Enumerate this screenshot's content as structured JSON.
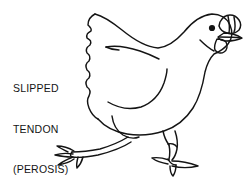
{
  "figure": {
    "background_color": "#ffffff",
    "ink_color": "#141414",
    "width": 248,
    "height": 180
  },
  "caption": {
    "line1": "SLIPPED",
    "line2": "TENDON",
    "line3": "(PEROSIS)"
  },
  "illustration": {
    "subject": "chicken",
    "style": "black-and-white line drawing",
    "parts": {
      "comb": "comb",
      "eye": "eye",
      "beak": "beak",
      "wattle": "wattle",
      "head": "head",
      "neck": "neck",
      "body": "body",
      "wing": "wing",
      "tail": "tail",
      "affected_leg": "splayed-left-leg",
      "normal_leg": "standing-right-leg"
    }
  }
}
